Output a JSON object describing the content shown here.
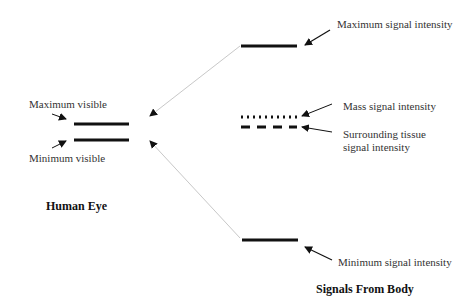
{
  "diagram": {
    "left_group": {
      "title": "Human Eye",
      "labels": {
        "max": "Maximum visible",
        "min": "Minimum visible"
      }
    },
    "right_group": {
      "title": "Signals From Body",
      "labels": {
        "max": "Maximum signal intensity",
        "mass": "Mass signal intensity",
        "surround_1": "Surrounding tissue",
        "surround_2": "signal intensity",
        "min": "Minimum signal intensity"
      }
    },
    "colors": {
      "bar": "#111111",
      "connector": "#c8c8c8",
      "arrow": "#111111"
    }
  }
}
